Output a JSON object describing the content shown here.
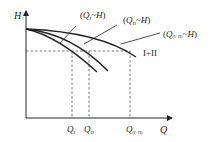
{
  "axes": {
    "y_label": "H",
    "x_label": "Q"
  },
  "curves": [
    {
      "id": "pump-I",
      "label_var": "Q",
      "label_sub": "I",
      "label_suffix": "~H",
      "label_open": "(",
      "label_close": ")"
    },
    {
      "id": "pump-II",
      "label_var": "Q",
      "label_sub": "II",
      "label_suffix": "~H",
      "label_open": "(",
      "label_close": ")"
    },
    {
      "id": "pump-I+II",
      "label_var": "Q",
      "label_sub": "(I+II)",
      "label_suffix": "~H",
      "label_open": "(",
      "label_close": ")"
    }
  ],
  "operating_point_label": "I+II",
  "x_ticks": [
    {
      "var": "Q",
      "sub": "I"
    },
    {
      "var": "Q",
      "sub": "II"
    },
    {
      "var": "Q",
      "sub": "(I+II)"
    }
  ],
  "colors": {
    "line": "#222222",
    "dash": "#555555",
    "background": "#ffffff"
  }
}
